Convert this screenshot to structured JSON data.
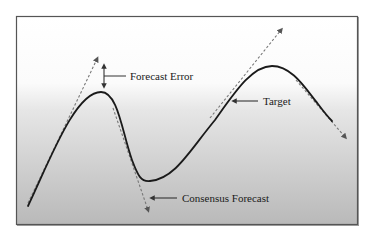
{
  "diagram": {
    "labels": {
      "forecast_error": "Forecast Error",
      "target": "Target",
      "consensus_forecast": "Consensus Forecast"
    },
    "colors": {
      "background_top": "#ffffff",
      "background_bottom": "#b8b8b8",
      "frame": "#555555",
      "curve": "#1a1a1a",
      "dashed": "#777777",
      "arrow": "#333333"
    }
  }
}
